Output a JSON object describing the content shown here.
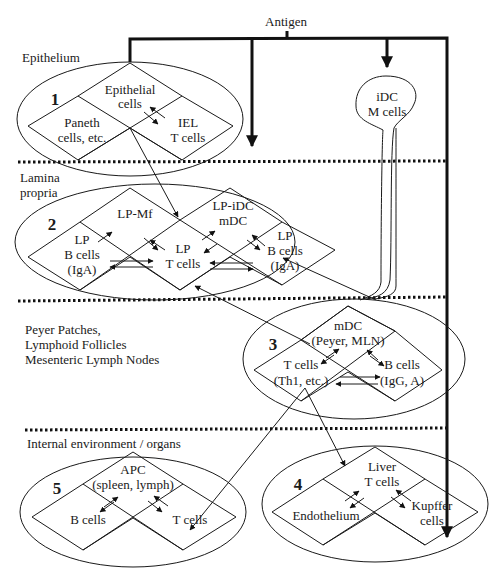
{
  "diagram": {
    "antigen_label": "Antigen",
    "compartments": [
      {
        "name": "epithelium",
        "label_lines": [
          "Epithelium"
        ]
      },
      {
        "name": "lamina-propria",
        "label_lines": [
          "Lamina",
          "propria"
        ]
      },
      {
        "name": "peyer-patches",
        "label_lines": [
          "Peyer Patches,",
          "Lymphoid Follicles",
          "Mesenteric Lymph Nodes"
        ]
      },
      {
        "name": "internal-environment",
        "label_lines": [
          "Internal environment / organs"
        ]
      }
    ],
    "standalone": {
      "name": "idc-m-cells",
      "label_lines": [
        "iDC",
        "M cells"
      ]
    },
    "regions": [
      {
        "number": "1",
        "cells": {
          "top": [
            "Epithelial",
            "cells"
          ],
          "left": [
            "Paneth",
            "cells, etc."
          ],
          "right": [
            "IEL",
            "T cells"
          ]
        }
      },
      {
        "number": "2",
        "cells": {
          "top_left": [
            "LP-Mf"
          ],
          "top_right": [
            "LP-iDC",
            "mDC"
          ],
          "left": [
            "LP",
            "B cells",
            "(IgA)"
          ],
          "center": [
            "LP",
            "T cells"
          ],
          "right": [
            "LP",
            "B cells",
            "(IgA)"
          ]
        }
      },
      {
        "number": "3",
        "cells": {
          "top": [
            "mDC",
            "(Peyer, MLN)"
          ],
          "left": [
            "T cells",
            "(Th1, etc.)"
          ],
          "right": [
            "B cells",
            "(IgG, A)"
          ]
        }
      },
      {
        "number": "4",
        "cells": {
          "top": [
            "Liver",
            "T cells"
          ],
          "left": [
            "Endothelium"
          ],
          "right": [
            "Kupffer",
            "cells"
          ]
        }
      },
      {
        "number": "5",
        "cells": {
          "top": [
            "APC",
            "(spleen, lymph)"
          ],
          "left": [
            "B cells"
          ],
          "right": [
            "T cells"
          ]
        }
      }
    ]
  }
}
